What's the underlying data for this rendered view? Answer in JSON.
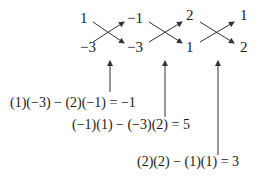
{
  "columns": [
    {
      "top": "1",
      "bottom": "2"
    },
    {
      "top": "−1",
      "bottom": "−3"
    },
    {
      "top": "2",
      "bottom": "1"
    },
    {
      "top": "1",
      "bottom": "2"
    }
  ],
  "equations": [
    {
      "text": "(1)(−3) − (2)(−1) = −1"
    },
    {
      "text": "(−1)(1) − (−3)(2) = 5"
    },
    {
      "text": "(2)(2) − (1)(1) = 3"
    }
  ],
  "colors": {
    "ink": "#1a1a1a",
    "arrow": "#333333"
  }
}
